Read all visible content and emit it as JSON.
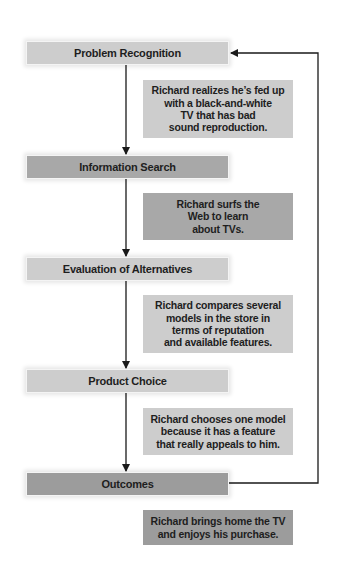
{
  "diagram": {
    "type": "consumer-decision-process-flowchart",
    "stages": [
      {
        "label": "Problem Recognition",
        "color": "#cdcdcd"
      },
      {
        "label": "Information Search",
        "color": "#a8a8a8"
      },
      {
        "label": "Evaluation of Alternatives",
        "color": "#cdcdcd"
      },
      {
        "label": "Product Choice",
        "color": "#cdcdcd"
      },
      {
        "label": "Outcomes",
        "color": "#9c9c9c"
      }
    ],
    "notes": [
      {
        "text": "Richard realizes he’s fed up\nwith a black-and-white\nTV that has bad\nsound reproduction.",
        "color": "#cdcdcd"
      },
      {
        "text": "Richard surfs the\nWeb to learn\nabout TVs.",
        "color": "#a8a8a8"
      },
      {
        "text": "Richard compares several\nmodels in the store in\nterms of reputation\nand available features.",
        "color": "#cdcdcd"
      },
      {
        "text": "Richard chooses one model\nbecause it has a feature\nthat really appeals to him.",
        "color": "#cdcdcd"
      },
      {
        "text": "Richard brings home the TV\nand enjoys his purchase.",
        "color": "#9c9c9c"
      }
    ],
    "edges": [
      {
        "from": "Problem Recognition",
        "to": "Information Search"
      },
      {
        "from": "Information Search",
        "to": "Evaluation of Alternatives"
      },
      {
        "from": "Evaluation of Alternatives",
        "to": "Product Choice"
      },
      {
        "from": "Product Choice",
        "to": "Outcomes"
      },
      {
        "from": "Outcomes",
        "to": "Problem Recognition",
        "kind": "feedback-loop"
      }
    ],
    "line_color": "#1a1a1a"
  }
}
